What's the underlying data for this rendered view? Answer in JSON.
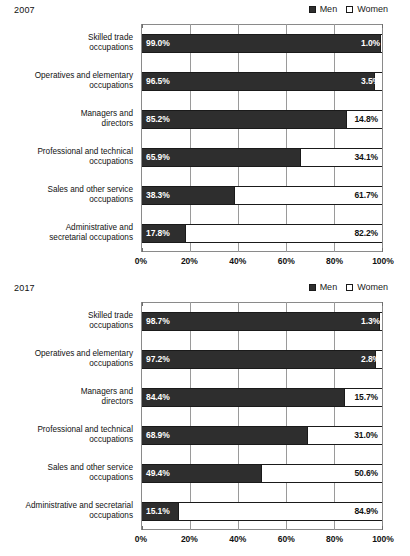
{
  "legend": {
    "men_label": "Men",
    "women_label": "Women",
    "men_color": "#2e2e2e",
    "women_color": "#ffffff"
  },
  "panels": [
    {
      "year": "2007"
    },
    {
      "year": "2017"
    }
  ],
  "axis": {
    "ticks": [
      "0%",
      "20%",
      "40%",
      "60%",
      "80%",
      "100%"
    ],
    "tick_values": [
      0,
      20,
      40,
      60,
      80,
      100
    ]
  },
  "chart_data": [
    {
      "type": "bar",
      "orientation": "horizontal",
      "stacked": true,
      "title": "2007",
      "xlabel": "",
      "ylabel": "",
      "xlim": [
        0,
        100
      ],
      "grid": true,
      "legend_position": "top-right",
      "categories": [
        "Skilled trade occupations",
        "Operatives and elementary occupations",
        "Managers and directors",
        "Professional and technical occupations",
        "Sales and other service occupations",
        "Administrative and secretarial occupations"
      ],
      "series": [
        {
          "name": "Men",
          "values": [
            99.0,
            96.5,
            85.2,
            65.9,
            38.3,
            17.8
          ]
        },
        {
          "name": "Women",
          "values": [
            1.0,
            3.5,
            14.8,
            34.1,
            61.7,
            82.2
          ]
        }
      ],
      "men_labels": [
        "99.0%",
        "96.5%",
        "85.2%",
        "65.9%",
        "38.3%",
        "17.8%"
      ],
      "women_labels": [
        "1.0%",
        "3.5%",
        "14.8%",
        "34.1%",
        "61.7%",
        "82.2%"
      ]
    },
    {
      "type": "bar",
      "orientation": "horizontal",
      "stacked": true,
      "title": "2017",
      "xlabel": "",
      "ylabel": "",
      "xlim": [
        0,
        100
      ],
      "grid": true,
      "legend_position": "top-right",
      "categories": [
        "Skilled trade occupations",
        "Operatives and elementary occupations",
        "Managers and directors",
        "Professional and technical occupations",
        "Sales and other service occupations",
        "Administrative and secretarial occupations"
      ],
      "series": [
        {
          "name": "Men",
          "values": [
            98.7,
            97.2,
            84.4,
            68.9,
            49.4,
            15.1
          ]
        },
        {
          "name": "Women",
          "values": [
            1.3,
            2.8,
            15.7,
            31.0,
            50.6,
            84.9
          ]
        }
      ],
      "men_labels": [
        "98.7%",
        "97.2%",
        "84.4%",
        "68.9%",
        "49.4%",
        "15.1%"
      ],
      "women_labels": [
        "1.3%",
        "2.8%",
        "15.7%",
        "31.0%",
        "50.6%",
        "84.9%"
      ]
    }
  ],
  "category_lines": [
    [
      "Skilled trade",
      "occupations"
    ],
    [
      "Operatives and elementary",
      "occupations"
    ],
    [
      "Managers and",
      "directors"
    ],
    [
      "Professional and technical",
      "occupations"
    ],
    [
      "Sales and other service",
      "occupations"
    ],
    [
      "Administrative and",
      "secretarial occupations"
    ]
  ],
  "category_lines_2017": [
    [
      "Skilled trade",
      "occupations"
    ],
    [
      "Operatives and elementary",
      "occupations"
    ],
    [
      "Managers and",
      "directors"
    ],
    [
      "Professional and technical",
      "occupations"
    ],
    [
      "Sales and other service",
      "occupations"
    ],
    [
      "Administrative and secretarial",
      "occupations"
    ]
  ]
}
